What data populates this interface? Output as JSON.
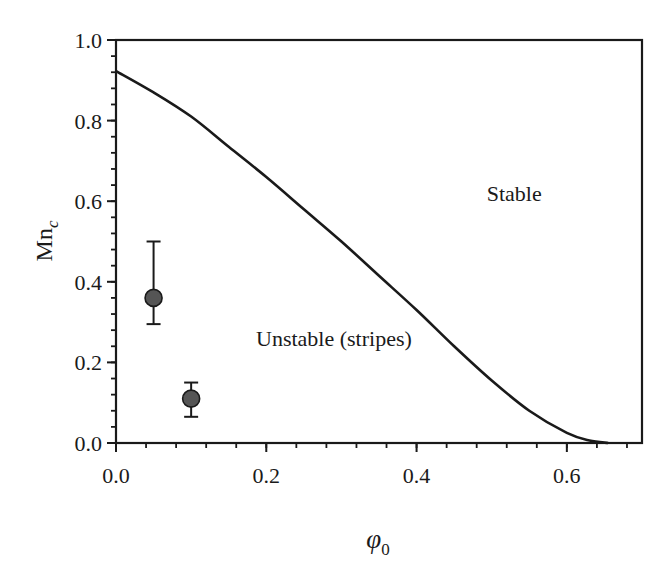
{
  "chart_data": {
    "type": "line",
    "title": "",
    "xlabel": "φ0",
    "xlabel_main": "φ",
    "xlabel_sub": "0",
    "ylabel": "Mnc",
    "ylabel_main": "Mn",
    "ylabel_sub": "c",
    "xlim": [
      0.0,
      0.7
    ],
    "ylim": [
      0.0,
      1.0
    ],
    "x_ticks": [
      0.0,
      0.2,
      0.4,
      0.6
    ],
    "x_tick_labels": [
      "0.0",
      "0.2",
      "0.4",
      "0.6"
    ],
    "x_minor_step": 0.04,
    "y_ticks": [
      0.0,
      0.2,
      0.4,
      0.6,
      0.8,
      1.0
    ],
    "y_tick_labels": [
      "0.0",
      "0.2",
      "0.4",
      "0.6",
      "0.8",
      "1.0"
    ],
    "y_minor_step": 0.04,
    "grid": false,
    "legend": null,
    "series": [
      {
        "name": "Stability boundary",
        "kind": "line",
        "color": "#1a1a1a",
        "x": [
          0.0,
          0.05,
          0.1,
          0.15,
          0.2,
          0.25,
          0.3,
          0.35,
          0.4,
          0.45,
          0.5,
          0.55,
          0.6,
          0.63,
          0.655
        ],
        "y": [
          0.923,
          0.87,
          0.81,
          0.735,
          0.66,
          0.58,
          0.5,
          0.415,
          0.33,
          0.24,
          0.155,
          0.08,
          0.025,
          0.006,
          0.0
        ]
      },
      {
        "name": "Experimental points",
        "kind": "scatter",
        "color": "#555555",
        "points": [
          {
            "x": 0.05,
            "y": 0.36,
            "y_low": 0.295,
            "y_high": 0.5
          },
          {
            "x": 0.1,
            "y": 0.11,
            "y_low": 0.065,
            "y_high": 0.15
          }
        ]
      }
    ],
    "annotations": [
      {
        "text": "Stable",
        "x": 0.53,
        "y": 0.6
      },
      {
        "text": "Unstable (stripes)",
        "x": 0.29,
        "y": 0.24
      }
    ]
  }
}
